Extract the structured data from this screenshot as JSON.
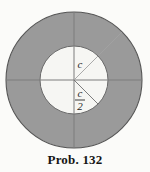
{
  "figure": {
    "name": "annulus-circle-diagram",
    "colors": {
      "background": "#fbfbf9",
      "ring_fill": "#9a9a9a",
      "inner_fill": "#f6f6f3",
      "outline": "#555555",
      "line": "#7a7a7a",
      "faint_line": "#9d9d9d",
      "text": "#262626"
    },
    "geometry": {
      "center_x": 74,
      "center_y": 80,
      "outer_radius": 68,
      "inner_radius": 34
    },
    "labels": {
      "outer_radius_label": "c",
      "inner_radius_numerator": "c",
      "inner_radius_denominator": "2"
    }
  },
  "caption": {
    "text": "Prob. 132"
  }
}
